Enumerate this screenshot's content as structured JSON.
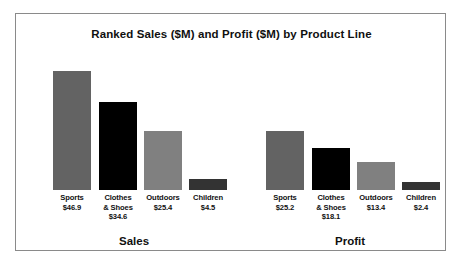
{
  "chart": {
    "title": "Ranked Sales ($M) and Profit ($M) by Product Line",
    "frame_border_color": "#8a8a8a",
    "background": "#ffffff"
  },
  "chart_data": {
    "type": "bar",
    "title": "Ranked Sales ($M) and Profit ($M) by Product Line",
    "xlabel": "",
    "ylabel": "",
    "grid": false,
    "legend": "none",
    "axis_visible": false,
    "categories": [
      "Sports",
      "Clothes & Shoes",
      "Outdoors",
      "Children"
    ],
    "category_colors": [
      "#636363",
      "#000000",
      "#808080",
      "#333333"
    ],
    "ylim": [
      0,
      50
    ],
    "series": [
      {
        "name": "Sales",
        "values": [
          46.9,
          34.6,
          25.4,
          4.5
        ],
        "value_labels": [
          "$46.9",
          "$34.6",
          "$25.4",
          "$4.5"
        ]
      },
      {
        "name": "Profit",
        "values": [
          25.2,
          18.1,
          13.4,
          2.4
        ],
        "value_labels": [
          "$25.2",
          "$18.1",
          "$13.4",
          "$2.4"
        ]
      }
    ]
  },
  "groups": [
    {
      "name": "Sales",
      "label": "Sales",
      "label_left": 58,
      "label_width": 120,
      "label_top": 221,
      "bars": [
        {
          "category": "Sports",
          "category_label": "Sports",
          "value": 46.9,
          "value_label": "$46.9",
          "color": "#636363",
          "left": 37,
          "top": 57,
          "width": 38,
          "height": 119,
          "label_left": 27,
          "label_width": 58,
          "label_top": 179
        },
        {
          "category": "Clothes & Shoes",
          "category_label": "Clothes\n& Shoes",
          "value": 34.6,
          "value_label": "$34.6",
          "color": "#000000",
          "left": 83,
          "top": 88,
          "width": 38,
          "height": 88,
          "label_left": 73,
          "label_width": 58,
          "label_top": 179
        },
        {
          "category": "Outdoors",
          "category_label": "Outdoors",
          "value": 25.4,
          "value_label": "$25.4",
          "color": "#808080",
          "left": 128,
          "top": 117,
          "width": 38,
          "height": 59,
          "label_left": 118,
          "label_width": 58,
          "label_top": 179
        },
        {
          "category": "Children",
          "category_label": "Children",
          "value": 4.5,
          "value_label": "$4.5",
          "color": "#333333",
          "left": 173,
          "top": 165,
          "width": 38,
          "height": 11,
          "label_left": 163,
          "label_width": 58,
          "label_top": 179
        }
      ]
    },
    {
      "name": "Profit",
      "label": "Profit",
      "label_left": 274,
      "label_width": 120,
      "label_top": 221,
      "bars": [
        {
          "category": "Sports",
          "category_label": "Sports",
          "value": 25.2,
          "value_label": "$25.2",
          "color": "#636363",
          "left": 250,
          "top": 117,
          "width": 38,
          "height": 59,
          "label_left": 240,
          "label_width": 58,
          "label_top": 179
        },
        {
          "category": "Clothes & Shoes",
          "category_label": "Clothes\n& Shoes",
          "value": 18.1,
          "value_label": "$18.1",
          "color": "#000000",
          "left": 296,
          "top": 134,
          "width": 38,
          "height": 42,
          "label_left": 286,
          "label_width": 58,
          "label_top": 179
        },
        {
          "category": "Outdoors",
          "category_label": "Outdoors",
          "value": 13.4,
          "value_label": "$13.4",
          "color": "#808080",
          "left": 341,
          "top": 148,
          "width": 38,
          "height": 28,
          "label_left": 331,
          "label_width": 58,
          "label_top": 179
        },
        {
          "category": "Children",
          "category_label": "Children",
          "value": 2.4,
          "value_label": "$2.4",
          "color": "#333333",
          "left": 386,
          "top": 168,
          "width": 38,
          "height": 8,
          "label_left": 376,
          "label_width": 58,
          "label_top": 179
        }
      ]
    }
  ]
}
